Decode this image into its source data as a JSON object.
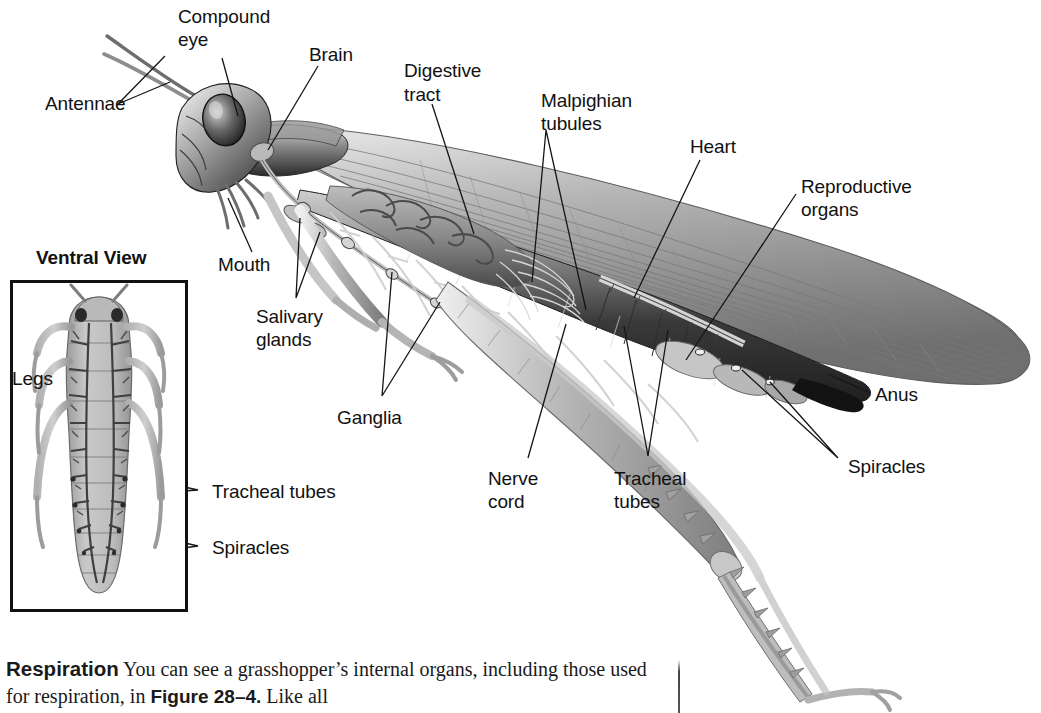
{
  "figure": {
    "inset_title": "Ventral View",
    "labels": {
      "antennae": "Antennae",
      "compound_eye_line1": "Compound",
      "compound_eye_line2": "eye",
      "brain": "Brain",
      "digestive_line1": "Digestive",
      "digestive_line2": "tract",
      "malpighian_line1": "Malpighian",
      "malpighian_line2": "tubules",
      "heart": "Heart",
      "reproductive_line1": "Reproductive",
      "reproductive_line2": "organs",
      "mouth": "Mouth",
      "salivary_line1": "Salivary",
      "salivary_line2": "glands",
      "ganglia": "Ganglia",
      "nerve_line1": "Nerve",
      "nerve_line2": "cord",
      "tracheal_main_line1": "Tracheal",
      "tracheal_main_line2": "tubes",
      "spiracles_right": "Spiracles",
      "anus": "Anus",
      "legs": "Legs",
      "tracheal_inset": "Tracheal tubes",
      "spiracles_inset": "Spiracles"
    }
  },
  "body_text": {
    "run_in_head": "Respiration",
    "sentence_part1": "  You can see a grasshopper’s internal organs, including those used for respiration, in ",
    "figure_reference": "Figure 28–4.",
    "sentence_part2": " Like all"
  },
  "colors": {
    "background": "#ffffff",
    "ink": "#111111",
    "leader_line": "#1a1a1a",
    "art_dark": "#2b2b2b",
    "art_mid": "#8a8a8a",
    "art_light": "#c9c9c9",
    "art_highlight": "#ededed"
  }
}
